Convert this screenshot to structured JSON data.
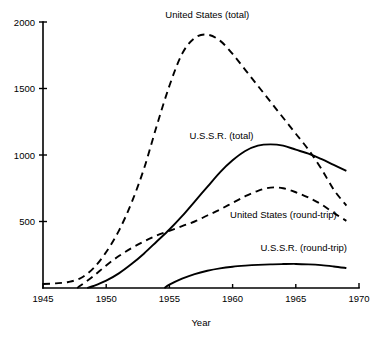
{
  "chart_data": {
    "type": "line",
    "title": "",
    "xlabel": "Year",
    "ylabel": "",
    "xlim": [
      1945,
      1970
    ],
    "ylim": [
      0,
      2000
    ],
    "grid": false,
    "legend_position": "inline-annotations",
    "x_ticks": [
      1945,
      1950,
      1955,
      1960,
      1965,
      1970
    ],
    "x_tick_labels": [
      "1945",
      "1950",
      "1955",
      "1960",
      "1965",
      "1970"
    ],
    "y_ticks": [
      500,
      1000,
      1500,
      2000
    ],
    "y_tick_labels": [
      "500",
      "1000",
      "1500",
      "2000"
    ],
    "series": [
      {
        "name": "United States (total)",
        "style": "dashed",
        "label_x": 1958.0,
        "label_y": 2030,
        "label_anchor": "middle",
        "x": [
          1945,
          1946,
          1947,
          1948,
          1949,
          1950,
          1951,
          1952,
          1953,
          1954,
          1955,
          1956,
          1957,
          1958,
          1959,
          1960,
          1961,
          1962,
          1963,
          1964,
          1965,
          1966,
          1967,
          1968,
          1969
        ],
        "y": [
          30,
          35,
          45,
          75,
          150,
          270,
          430,
          640,
          900,
          1220,
          1520,
          1760,
          1880,
          1905,
          1860,
          1760,
          1640,
          1520,
          1400,
          1280,
          1160,
          1040,
          900,
          740,
          620
        ]
      },
      {
        "name": "U.S.S.R. (total)",
        "style": "solid",
        "label_x": 1956.6,
        "label_y": 1120,
        "label_anchor": "start",
        "x": [
          1948.5,
          1949,
          1950,
          1951,
          1952,
          1953,
          1954,
          1955,
          1956,
          1957,
          1958,
          1959,
          1960,
          1961,
          1962,
          1963,
          1964,
          1965,
          1966,
          1967,
          1968,
          1969
        ],
        "y": [
          0,
          15,
          55,
          110,
          180,
          260,
          350,
          440,
          540,
          650,
          760,
          870,
          960,
          1030,
          1070,
          1080,
          1070,
          1040,
          1010,
          970,
          925,
          880
        ]
      },
      {
        "name": "United States (round-trip)",
        "style": "dashed",
        "label_x": 1959.8,
        "label_y": 530,
        "label_anchor": "start",
        "x": [
          1947.7,
          1948,
          1949,
          1950,
          1951,
          1952,
          1953,
          1954,
          1955,
          1956,
          1957,
          1958,
          1959,
          1960,
          1961,
          1962,
          1963,
          1964,
          1965,
          1966,
          1967,
          1968,
          1969
        ],
        "y": [
          0,
          20,
          90,
          170,
          240,
          300,
          350,
          395,
          430,
          465,
          500,
          545,
          590,
          640,
          690,
          730,
          755,
          750,
          720,
          680,
          630,
          565,
          505
        ]
      },
      {
        "name": "U.S.S.R. (round-trip)",
        "style": "solid",
        "label_x": 1962.2,
        "label_y": 275,
        "label_anchor": "start",
        "x": [
          1954.6,
          1955,
          1956,
          1957,
          1958,
          1959,
          1960,
          1961,
          1962,
          1963,
          1964,
          1965,
          1966,
          1967,
          1968,
          1969
        ],
        "y": [
          0,
          25,
          70,
          105,
          130,
          148,
          160,
          168,
          174,
          178,
          180,
          181,
          178,
          172,
          162,
          150
        ]
      }
    ]
  },
  "axis": {
    "x_title": "Year"
  },
  "colors": {
    "ink": "#000000",
    "background": "#ffffff"
  }
}
